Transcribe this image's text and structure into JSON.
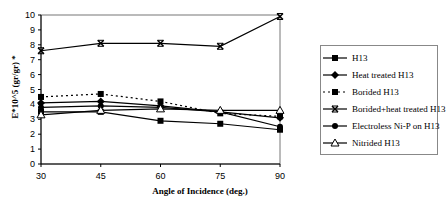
{
  "chart_data": {
    "type": "line",
    "title": "",
    "xlabel": "Angle of Incidence (deg.)",
    "ylabel": "E*10^5 (gr/gr) *",
    "x": [
      30,
      45,
      60,
      75,
      90
    ],
    "xlim": [
      30,
      90
    ],
    "ylim": [
      0,
      10
    ],
    "yticks": [
      0,
      1,
      2,
      3,
      4,
      5,
      6,
      7,
      8,
      9,
      10
    ],
    "grid": false,
    "legend_position": "right",
    "series": [
      {
        "name": "H13",
        "marker": "square",
        "dash": "solid",
        "values": [
          3.5,
          3.5,
          2.9,
          2.7,
          2.3
        ]
      },
      {
        "name": "Heat treated H13",
        "marker": "diamond",
        "dash": "solid",
        "values": [
          4.1,
          4.2,
          3.9,
          3.5,
          3.1
        ]
      },
      {
        "name": "Borided H13",
        "marker": "square",
        "dash": "dotted",
        "values": [
          4.5,
          4.7,
          4.2,
          3.4,
          3.2
        ]
      },
      {
        "name": "Borided+heat treated H13",
        "marker": "x",
        "dash": "solid",
        "values": [
          7.6,
          8.1,
          8.1,
          7.9,
          9.9
        ]
      },
      {
        "name": "Electroless Ni-P on H13",
        "marker": "circle",
        "dash": "solid",
        "values": [
          3.8,
          3.9,
          3.8,
          3.5,
          2.5
        ]
      },
      {
        "name": "Nitrided H13",
        "marker": "triangle",
        "dash": "solid",
        "values": [
          3.3,
          3.6,
          3.7,
          3.6,
          3.6
        ]
      }
    ]
  }
}
